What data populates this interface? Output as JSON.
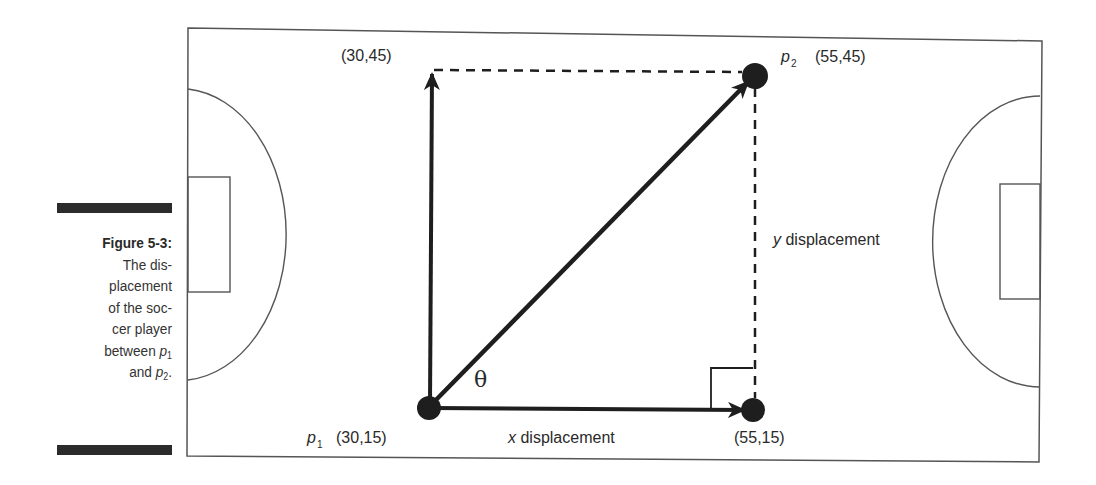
{
  "caption": {
    "figure_label": "Figure 5-3:",
    "lines": [
      "The dis-",
      "placement",
      "of the soc-",
      "cer player"
    ],
    "between": "between ",
    "p": "p",
    "sub1": "1",
    "and": "and ",
    "sub2": "2",
    "period": "."
  },
  "points": {
    "p1": {
      "name": "p",
      "sub": "1",
      "coords": "(30,15)"
    },
    "p2": {
      "name": "p",
      "sub": "2",
      "coords": "(55,45)"
    },
    "top_left": {
      "coords": "(30,45)"
    },
    "bottom_right": {
      "coords": "(55,15)"
    }
  },
  "labels": {
    "x_var": "x",
    "x_text": " displacement",
    "y_var": "y",
    "y_text": " displacement",
    "angle": "θ"
  },
  "colors": {
    "ink": "#1e1e1e",
    "field_line": "#555555",
    "background": "#ffffff"
  }
}
